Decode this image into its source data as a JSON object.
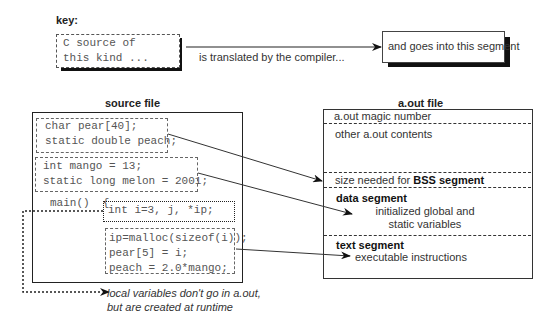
{
  "key": {
    "label": "key:",
    "source_line1": "C source of",
    "source_line2": "this kind ...",
    "arrow_label": "is translated by the compiler...",
    "segment_label": "and goes into this segment"
  },
  "source_file": {
    "title": "source file",
    "block1": [
      "char pear[40];",
      "static double peach;"
    ],
    "block2": [
      "int mango = 13;",
      "static long melon = 2001;"
    ],
    "main_line": "main()  {",
    "block3": [
      "int i=3, j, *ip;"
    ],
    "block4": [
      "ip=malloc(sizeof(i));",
      "pear[5] = i;",
      "peach = 2.0*mango;"
    ]
  },
  "aout_file": {
    "title": "a.out file",
    "magic": "a.out magic number",
    "other": "other a.out contents",
    "bss_prefix": "size needed for ",
    "bss_bold": "BSS segment",
    "data_title": "data segment",
    "data_line1": "initialized global and",
    "data_line2": "static variables",
    "text_title": "text segment",
    "text_line1": "executable instructions"
  },
  "note": {
    "line1": "local variables don't go in a.out,",
    "line2": "but are created at runtime"
  }
}
